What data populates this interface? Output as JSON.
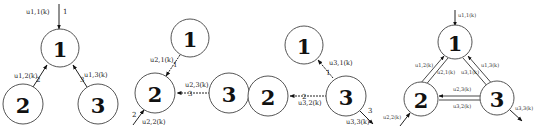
{
  "diagram": {
    "panels": [
      {
        "id": "a",
        "nodes": [
          {
            "id": "1",
            "label": "1"
          },
          {
            "id": "2",
            "label": "2"
          },
          {
            "id": "3",
            "label": "3"
          }
        ],
        "edges": [
          {
            "from": "external",
            "to": "1",
            "label": "u1,1(k)",
            "port": "1"
          },
          {
            "from": "2",
            "to": "1",
            "label": "u1,2(k)",
            "port": "2"
          },
          {
            "from": "3",
            "to": "1",
            "label": "u1,3(k)",
            "port": "3"
          }
        ]
      },
      {
        "id": "b",
        "nodes": [
          {
            "id": "1",
            "label": "1"
          },
          {
            "id": "2",
            "label": "2"
          },
          {
            "id": "3",
            "label": "3"
          }
        ],
        "edges": [
          {
            "from": "1",
            "to": "2",
            "label": "u2,1(k)",
            "port": "1"
          },
          {
            "from": "3",
            "to": "2",
            "label": "u2,3(k)",
            "port": "3"
          },
          {
            "from": "external",
            "to": "2",
            "label": "u2,2(k)",
            "port": "2"
          }
        ]
      },
      {
        "id": "c",
        "nodes": [
          {
            "id": "1",
            "label": "1"
          },
          {
            "id": "2",
            "label": "2"
          },
          {
            "id": "3",
            "label": "3"
          }
        ],
        "edges": [
          {
            "from": "3",
            "to": "1",
            "label": "u3,1(k)",
            "port": "1"
          },
          {
            "from": "3",
            "to": "2",
            "label": "u3,2(k)",
            "port": "2"
          },
          {
            "from": "3",
            "to": "external",
            "label": "u3,3(k)",
            "port": "3"
          }
        ]
      },
      {
        "id": "d",
        "nodes": [
          {
            "id": "1",
            "label": "1"
          },
          {
            "id": "2",
            "label": "2"
          },
          {
            "id": "3",
            "label": "3"
          }
        ],
        "edges": [
          {
            "from": "external",
            "to": "1",
            "label": "u1,1(k)"
          },
          {
            "from": "2",
            "to": "1",
            "label": "u1,2(k)"
          },
          {
            "from": "1",
            "to": "2",
            "label": "u2,1(k)"
          },
          {
            "from": "3",
            "to": "1",
            "label": "u1,3(k)"
          },
          {
            "from": "1",
            "to": "3",
            "label": "u3,1(k)"
          },
          {
            "from": "3",
            "to": "2",
            "label": "u2,3(k)"
          },
          {
            "from": "2",
            "to": "3",
            "label": "u3,2(k)"
          },
          {
            "from": "external",
            "to": "2",
            "label": "u2,2(k)"
          },
          {
            "from": "3",
            "to": "external",
            "label": "u3,3(k)"
          }
        ]
      }
    ]
  }
}
